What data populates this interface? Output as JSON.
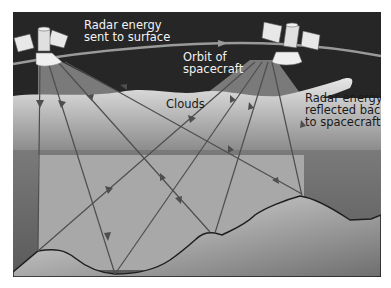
{
  "diagram": {
    "type": "radar remote sensing illustration",
    "labels": {
      "radar_sent_line1": "Radar energy",
      "radar_sent_line2": "sent to surface",
      "orbit_line1": "Orbit of",
      "orbit_line2": "spacecraft",
      "clouds": "Clouds",
      "reflected_line1": "Radar energy",
      "reflected_line2": "reflected back",
      "reflected_line3": "to spacecraft"
    },
    "elements": [
      "satellite-left",
      "satellite-right",
      "orbit-path",
      "cloud-layer",
      "atmosphere-band",
      "terrain-surface",
      "radar-beams"
    ],
    "colors": {
      "sky": "#2a2a2a",
      "cloud": "#dcdcdc",
      "beam": "#9a9a9a",
      "terrain_light": "#d6d6d6",
      "terrain_dark": "#6a6a6a",
      "ray": "#555555"
    }
  }
}
